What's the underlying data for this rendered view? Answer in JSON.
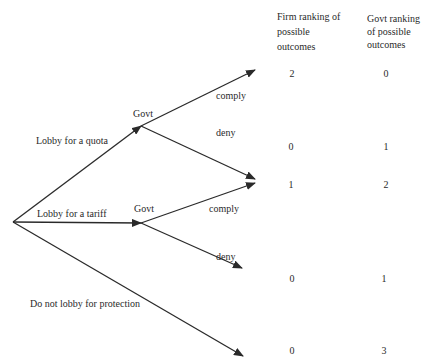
{
  "headers": {
    "firm": "Firm ranking of possible outcomes",
    "govt": "Govt ranking of possible outcomes"
  },
  "root": {
    "branches": [
      {
        "label": "Lobby for a quota"
      },
      {
        "label": "Lobby for a tariff"
      },
      {
        "label": "Do not lobby for protection"
      }
    ]
  },
  "nodes": [
    {
      "label": "Govt",
      "branches": [
        {
          "label": "comply"
        },
        {
          "label": "deny"
        }
      ]
    },
    {
      "label": "Govt",
      "branches": [
        {
          "label": "comply"
        },
        {
          "label": "deny"
        }
      ]
    }
  ],
  "outcomes": [
    {
      "path": "Lobby for a quota / comply",
      "firm": "2",
      "govt": "0"
    },
    {
      "path": "Lobby for a quota / deny",
      "firm": "0",
      "govt": "1"
    },
    {
      "path": "Lobby for a tariff / comply",
      "firm": "1",
      "govt": "2"
    },
    {
      "path": "Lobby for a tariff / deny",
      "firm": "0",
      "govt": "1"
    },
    {
      "path": "Do not lobby for protection",
      "firm": "0",
      "govt": "3"
    }
  ],
  "colors": {
    "line": "#2a2a2a",
    "text": "#2a2a2a",
    "background": "#ffffff"
  }
}
